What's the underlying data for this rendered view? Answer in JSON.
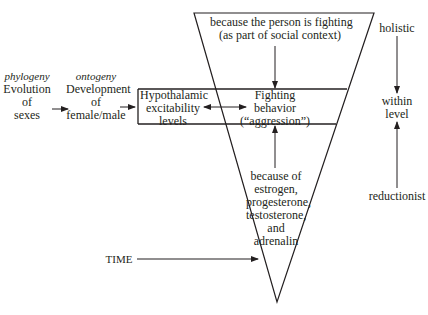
{
  "left_chain": {
    "phylogeny": {
      "level": "phylogeny",
      "lines": [
        "Evolution",
        "of",
        "sexes"
      ]
    },
    "ontogeny": {
      "level": "ontogeny",
      "lines": [
        "Development",
        "of",
        "female/male"
      ]
    },
    "hypothalamic": {
      "lines": [
        "Hypothalamic",
        "excitability",
        "levels"
      ]
    }
  },
  "center": {
    "top_cause": {
      "lines": [
        "because the person is fighting",
        "(as part of social context)"
      ]
    },
    "behavior": {
      "lines": [
        "Fighting",
        "behavior",
        "(“aggression”)"
      ]
    },
    "bottom_cause": {
      "lines": [
        "because of",
        "estrogen,",
        "progesterone,",
        "testosterone,",
        "and",
        "adrenalin"
      ]
    }
  },
  "right_axis": {
    "top": "holistic",
    "middle": [
      "within",
      "level"
    ],
    "bottom": "reductionist"
  },
  "time_label": "TIME",
  "colors": {
    "ink": "#231f20",
    "background": "#ffffff"
  }
}
